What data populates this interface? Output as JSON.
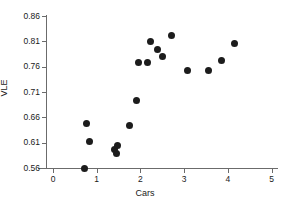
{
  "chart_data": {
    "type": "scatter",
    "title": "",
    "xlabel": "Cars",
    "ylabel": "VLE",
    "xlim": [
      0,
      5
    ],
    "ylim": [
      0.56,
      0.86
    ],
    "xticks": [
      0,
      1,
      2,
      3,
      4,
      5
    ],
    "yticks": [
      0.56,
      0.61,
      0.66,
      0.71,
      0.76,
      0.81,
      0.86
    ],
    "xtick_labels": [
      "0",
      "1",
      "2",
      "3",
      "4",
      "5"
    ],
    "ytick_labels": [
      "0.56",
      "0.61",
      "0.66",
      "0.71",
      "0.76",
      "0.81",
      "0.86"
    ],
    "grid": false,
    "legend": false,
    "marker": "filled-circle",
    "marker_color": "#1c1c1c",
    "axis_color": "#6b6b6b",
    "points": [
      {
        "x": 0.72,
        "y": 0.56
      },
      {
        "x": 0.77,
        "y": 0.648
      },
      {
        "x": 0.83,
        "y": 0.612
      },
      {
        "x": 1.4,
        "y": 0.596
      },
      {
        "x": 1.46,
        "y": 0.588
      },
      {
        "x": 1.48,
        "y": 0.604
      },
      {
        "x": 1.75,
        "y": 0.643
      },
      {
        "x": 1.91,
        "y": 0.693
      },
      {
        "x": 1.95,
        "y": 0.769
      },
      {
        "x": 2.17,
        "y": 0.769
      },
      {
        "x": 2.22,
        "y": 0.81
      },
      {
        "x": 2.39,
        "y": 0.793
      },
      {
        "x": 2.5,
        "y": 0.78
      },
      {
        "x": 2.72,
        "y": 0.822
      },
      {
        "x": 3.08,
        "y": 0.752
      },
      {
        "x": 3.55,
        "y": 0.752
      },
      {
        "x": 3.85,
        "y": 0.773
      },
      {
        "x": 4.15,
        "y": 0.805
      }
    ]
  }
}
